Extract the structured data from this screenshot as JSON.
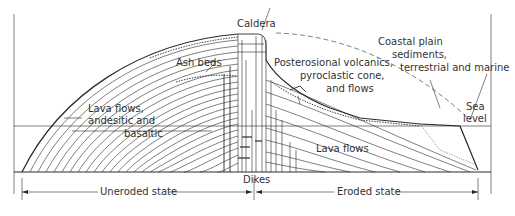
{
  "diagram": {
    "type": "geologic-cross-section",
    "labels": {
      "caldera": "Caldera",
      "ash_beds": "Ash beds",
      "lava_flows_left_1": "Lava flows,",
      "lava_flows_left_2": "andesitic and",
      "lava_flows_left_3": "basaltic",
      "posterosional_1": "Posterosional volcanics,",
      "posterosional_2": "pyroclastic cone,",
      "posterosional_3": "and flows",
      "coastal_1": "Coastal plain",
      "coastal_2": "sediments,",
      "coastal_3": "terrestrial and marine",
      "sea_1": "Sea",
      "sea_2": "level",
      "lava_flows_right": "Lava flows",
      "dikes": "Dikes",
      "uneroded": "Uneroded state",
      "eroded": "Eroded state"
    },
    "colors": {
      "line": "#2a2a2a",
      "text": "#333333",
      "background": "#ffffff"
    }
  }
}
